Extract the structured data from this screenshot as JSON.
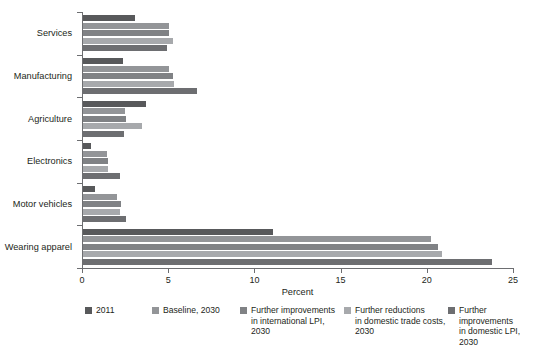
{
  "chart_data": {
    "type": "bar",
    "orientation": "horizontal",
    "title": "",
    "xlabel": "Percent",
    "ylabel": "",
    "xlim": [
      0,
      25
    ],
    "xticks": [
      0,
      5,
      10,
      15,
      20,
      25
    ],
    "xticklabels": [
      "0",
      "5",
      "10",
      "15",
      "20",
      "25"
    ],
    "grid": false,
    "legend_position": "bottom",
    "categories": [
      "Services",
      "Manufacturing",
      "Agriculture",
      "Electronics",
      "Motor vehicles",
      "Wearing apparel"
    ],
    "series": [
      {
        "name": "2011",
        "color": "#58595b",
        "values": [
          3.0,
          2.3,
          3.65,
          0.45,
          0.7,
          11.0
        ]
      },
      {
        "name": "Baseline, 2030",
        "color": "#939598",
        "values": [
          5.0,
          5.0,
          2.45,
          1.4,
          2.0,
          20.2
        ]
      },
      {
        "name": "Further improvements\nin international LPI,\n2030",
        "color": "#808285",
        "values": [
          5.0,
          5.2,
          2.5,
          1.45,
          2.2,
          20.6
        ]
      },
      {
        "name": "Further reductions\nin domestic trade costs,\n2030",
        "color": "#a7a9ac",
        "values": [
          5.2,
          5.3,
          3.45,
          1.45,
          2.15,
          20.8
        ]
      },
      {
        "name": "Further improvements\nin domestic LPI,\n2030",
        "color": "#6d6e71",
        "values": [
          4.9,
          6.6,
          2.4,
          2.15,
          2.5,
          23.7
        ]
      }
    ]
  },
  "legend": {
    "items": [
      {
        "label": "2011",
        "color": "#58595b"
      },
      {
        "label": "Baseline, 2030",
        "color": "#939598"
      },
      {
        "label": "Further improvements\nin international LPI,\n2030",
        "color": "#808285"
      },
      {
        "label": "Further reductions\nin domestic trade costs,\n2030",
        "color": "#a7a9ac"
      },
      {
        "label": "Further improvements\nin domestic LPI,\n2030",
        "color": "#6d6e71"
      }
    ]
  }
}
